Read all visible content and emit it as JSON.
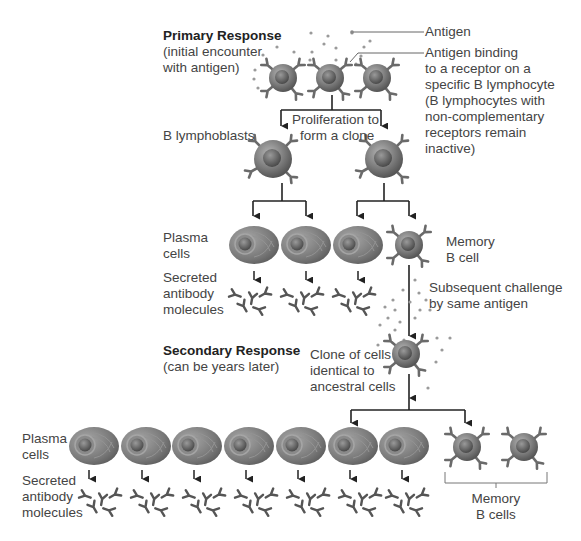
{
  "primary": {
    "title": "Primary Response",
    "subtitle_line1": "(initial encounter",
    "subtitle_line2": "with antigen)"
  },
  "callouts": {
    "antigen": "Antigen",
    "binding_line1": "Antigen binding",
    "binding_line2": "to a receptor on a",
    "binding_line3": "specific B lymphocyte",
    "binding_line4": "(B lymphocytes with",
    "binding_line5": "non-complementary",
    "binding_line6": "receptors remain",
    "binding_line7": "inactive)"
  },
  "proliferation": {
    "line1": "Proliferation to",
    "line2": "form a clone"
  },
  "lymphoblasts_label": "B lymphoblasts",
  "primary_stage": {
    "plasma_line1": "Plasma",
    "plasma_line2": "cells",
    "secreted_line1": "Secreted",
    "secreted_line2": "antibody",
    "secreted_line3": "molecules",
    "memory_line1": "Memory",
    "memory_line2": "B cell"
  },
  "challenge": {
    "line1": "Subsequent challenge",
    "line2": "by same antigen"
  },
  "secondary": {
    "title": "Secondary Response",
    "subtitle": "(can be years later)",
    "clone_line1": "Clone of cells",
    "clone_line2": "identical to",
    "clone_line3": "ancestral cells"
  },
  "secondary_stage": {
    "plasma_line1": "Plasma",
    "plasma_line2": "cells",
    "secreted_line1": "Secreted",
    "secreted_line2": "antibody",
    "secreted_line3": "molecules",
    "memory_line1": "Memory",
    "memory_line2": "B cells"
  },
  "colors": {
    "line": "#222222",
    "cell": "#7a7a7a",
    "antigen_dot": "#9a9a9a",
    "antibody": "#5a5a5a"
  }
}
